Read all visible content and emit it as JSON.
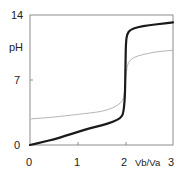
{
  "chart_data": {
    "type": "line",
    "title": "",
    "xlabel": "Vb/Va",
    "ylabel": "pH",
    "xlim": [
      0,
      3
    ],
    "ylim": [
      0,
      14
    ],
    "x_ticks": [
      "0",
      "1",
      "2",
      "3"
    ],
    "y_ticks": [
      "0",
      "7",
      "14"
    ],
    "grid": false,
    "legend": null,
    "series": [
      {
        "name": "strong acid titration (dark)",
        "color": "#1a1a1a",
        "line_width": 2.2,
        "x": [
          0,
          0.25,
          0.5,
          0.75,
          1.0,
          1.25,
          1.5,
          1.75,
          1.9,
          1.96,
          1.99,
          2.0,
          2.01,
          2.04,
          2.1,
          2.25,
          2.5,
          2.75,
          3.0
        ],
        "y": [
          0.0,
          0.3,
          0.6,
          1.0,
          1.4,
          1.8,
          2.1,
          2.5,
          2.9,
          3.4,
          5.0,
          7.5,
          11.0,
          12.0,
          12.4,
          12.7,
          12.9,
          13.05,
          13.2
        ]
      },
      {
        "name": "weak acid titration (light)",
        "color": "#b5b5b5",
        "line_width": 1.0,
        "x": [
          0,
          0.25,
          0.5,
          0.75,
          1.0,
          1.25,
          1.5,
          1.75,
          1.9,
          1.97,
          2.0,
          2.03,
          2.1,
          2.25,
          2.5,
          2.75,
          3.0
        ],
        "y": [
          2.8,
          2.9,
          3.0,
          3.15,
          3.3,
          3.45,
          3.6,
          4.0,
          4.5,
          5.0,
          6.5,
          8.5,
          9.2,
          9.6,
          9.9,
          10.1,
          10.2
        ]
      }
    ]
  },
  "labels": {
    "y_top": "14",
    "y_mid": "7",
    "y_bottom": "0",
    "y_title": "pH",
    "x_0": "0",
    "x_1": "1",
    "x_2": "2",
    "x_3": "3",
    "x_title": "Vb/Va"
  },
  "colors": {
    "frame": "#8c8c8c",
    "dark_curve": "#1a1a1a",
    "light_curve": "#b5b5b5"
  }
}
